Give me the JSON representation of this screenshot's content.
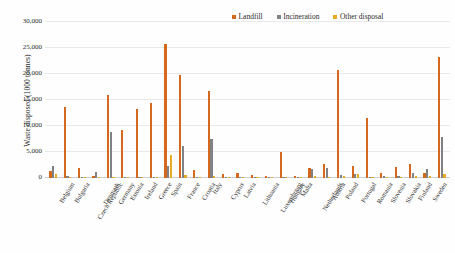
{
  "chart_data": {
    "type": "bar",
    "title": "",
    "xlabel": "",
    "ylabel": "Waste disposed (1000 tonnes)",
    "ylim": [
      0,
      30000
    ],
    "yticks": [
      "0",
      "5,000",
      "10,000",
      "15,000",
      "20,000",
      "25,000",
      "30,000"
    ],
    "ytick_values": [
      0,
      5000,
      10000,
      15000,
      20000,
      25000,
      30000
    ],
    "grid": true,
    "legend_position": "top-right",
    "colors": {
      "landfill": "#d4691e",
      "incineration": "#808285",
      "other_disposal": "#e8ab24"
    },
    "categories": [
      "Belgium",
      "Bulgaria",
      "Czech Republic",
      "Denmark",
      "Germany",
      "Estonia",
      "Ireland",
      "Greece",
      "Spain",
      "France",
      "Croatia",
      "Italy",
      "Cyprus",
      "Latvia",
      "Lithuania",
      "Luxembourg",
      "Hungary",
      "Malta",
      "Netherlands",
      "Austria",
      "Poland",
      "Portugal",
      "Romania",
      "Slovenia",
      "Slovakia",
      "Finland",
      "Sweden",
      "United Kingdom"
    ],
    "series": [
      {
        "name": "Landfill",
        "color": "#d4691e",
        "values": [
          1400,
          13700,
          1900,
          300,
          16000,
          9200,
          13200,
          14400,
          25800,
          19900,
          1600,
          16700,
          700,
          900,
          600,
          300,
          5000,
          300,
          2000,
          2700,
          20700,
          2300,
          11500,
          900,
          2200,
          2700,
          900,
          23200
        ]
      },
      {
        "name": "Incineration",
        "color": "#808285",
        "values": [
          2300,
          300,
          200,
          1200,
          8900,
          200,
          100,
          200,
          2300,
          6100,
          100,
          7500,
          100,
          100,
          100,
          200,
          200,
          100,
          1800,
          1900,
          600,
          800,
          200,
          300,
          400,
          900,
          1700,
          7900
        ]
      },
      {
        "name": "Other disposal",
        "color": "#e8ab24",
        "values": [
          800,
          200,
          100,
          100,
          200,
          100,
          100,
          100,
          4500,
          500,
          100,
          400,
          100,
          100,
          100,
          100,
          200,
          100,
          300,
          200,
          300,
          700,
          200,
          200,
          200,
          400,
          300,
          700
        ]
      }
    ]
  },
  "legend": {
    "items": [
      {
        "label": "Landfill",
        "color": "#d4691e"
      },
      {
        "label": "Incineration",
        "color": "#808285"
      },
      {
        "label": "Other disposal",
        "color": "#e8ab24"
      }
    ]
  }
}
